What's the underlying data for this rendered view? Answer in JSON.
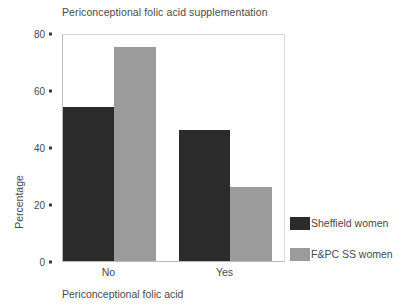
{
  "chart_data": {
    "type": "bar",
    "title": "Periconceptional folic acid supplementation",
    "xlabel": "Periconceptional folic acid",
    "ylabel": "Percentage",
    "categories": [
      "No",
      "Yes"
    ],
    "series": [
      {
        "name": "Sheffield women",
        "values": [
          54,
          46
        ],
        "color": "#2b2b2b"
      },
      {
        "name": "F&PC SS women",
        "values": [
          75,
          26
        ],
        "color": "#9b9b9b"
      }
    ],
    "ylim": [
      0,
      80
    ],
    "yticks": [
      0,
      20,
      40,
      60,
      80
    ],
    "ytick_labels": [
      "0",
      "20",
      "40",
      "60",
      "80"
    ],
    "grid": false,
    "legend_position": "right"
  },
  "legend": {
    "entries": [
      {
        "label": "Sheffield women"
      },
      {
        "label": "F&PC SS women"
      }
    ]
  }
}
